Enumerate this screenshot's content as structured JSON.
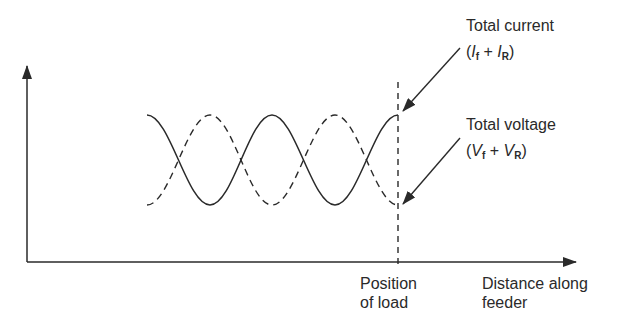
{
  "labels": {
    "current_title": "Total current",
    "current_formula_open": "(",
    "current_var1": "I",
    "current_sub1": "f",
    "current_plus": " + ",
    "current_var2": "I",
    "current_sub2": "R",
    "current_formula_close": ")",
    "voltage_title": "Total voltage",
    "voltage_formula_open": "(",
    "voltage_var1": "V",
    "voltage_sub1": "f",
    "voltage_plus": " + ",
    "voltage_var2": "V",
    "voltage_sub2": "R",
    "voltage_formula_close": ")",
    "load_line1": "Position",
    "load_line2": "of load",
    "xaxis_line1": "Distance along",
    "xaxis_line2": "feeder"
  },
  "colors": {
    "ink": "#2a2a2a",
    "background": "#ffffff"
  },
  "curves": [
    {
      "name": "Total current",
      "style": "solid",
      "phase": "max at start and at load"
    },
    {
      "name": "Total voltage",
      "style": "dashed",
      "phase": "min at start and at load"
    }
  ]
}
